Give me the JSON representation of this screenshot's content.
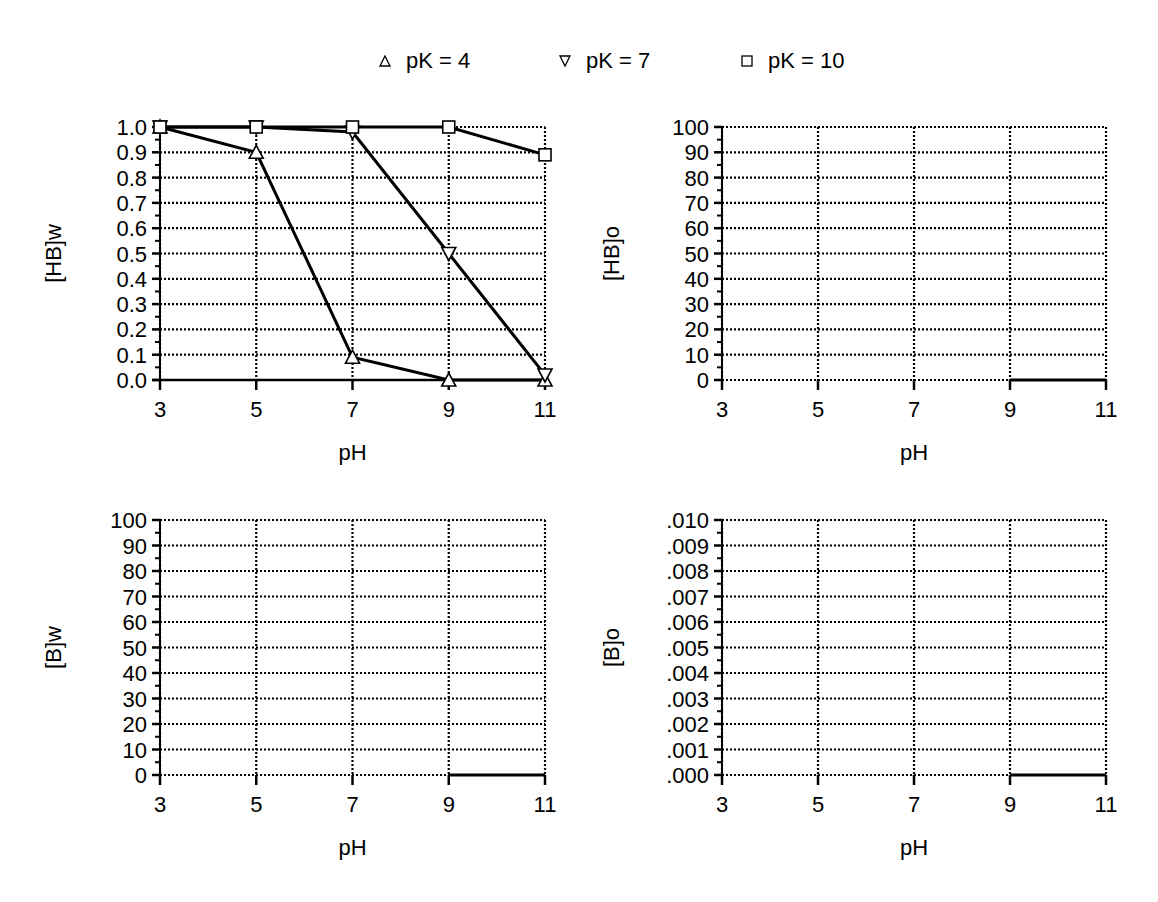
{
  "legend": {
    "items": [
      {
        "label": "pK = 4",
        "marker": "triangle-up",
        "x": 378
      },
      {
        "label": "pK = 7",
        "marker": "triangle-down",
        "x": 558
      },
      {
        "label": "pK = 10",
        "marker": "square",
        "x": 740
      }
    ]
  },
  "chart_data": [
    {
      "id": "hb-w",
      "type": "line",
      "title": "",
      "xlabel": "pH",
      "ylabel": "[HB]w",
      "x": [
        3,
        5,
        7,
        9,
        11
      ],
      "xticks": [
        "3",
        "5",
        "7",
        "9",
        "11"
      ],
      "ylim": [
        0,
        1.0
      ],
      "yticks": [
        "0.0",
        "0.1",
        "0.2",
        "0.3",
        "0.4",
        "0.5",
        "0.6",
        "0.7",
        "0.8",
        "0.9",
        "1.0"
      ],
      "grid": true,
      "legend_position": "top",
      "series": [
        {
          "name": "pK = 4",
          "marker": "triangle-up",
          "values": [
            1.0,
            0.9,
            0.09,
            0.0,
            0.0
          ]
        },
        {
          "name": "pK = 7",
          "marker": "triangle-down",
          "values": [
            1.0,
            1.0,
            0.98,
            0.5,
            0.02
          ]
        },
        {
          "name": "pK = 10",
          "marker": "square",
          "values": [
            1.0,
            1.0,
            1.0,
            1.0,
            0.89
          ]
        }
      ],
      "frame": {
        "left": 160,
        "right": 545,
        "top": 127,
        "bottom": 380
      }
    },
    {
      "id": "hb-o",
      "type": "line",
      "title": "",
      "xlabel": "pH",
      "ylabel": "[HB]o",
      "x": [
        3,
        5,
        7,
        9,
        11
      ],
      "xticks": [
        "3",
        "5",
        "7",
        "9",
        "11"
      ],
      "ylim": [
        0,
        100
      ],
      "yticks": [
        "0",
        "10",
        "20",
        "30",
        "40",
        "50",
        "60",
        "70",
        "80",
        "90",
        "100"
      ],
      "grid": true,
      "series": [
        {
          "name": "baseline",
          "values": [
            null,
            null,
            null,
            0,
            0
          ]
        }
      ],
      "frame": {
        "left": 722,
        "right": 1106,
        "top": 127,
        "bottom": 380
      }
    },
    {
      "id": "b-w",
      "type": "line",
      "title": "",
      "xlabel": "pH",
      "ylabel": "[B]w",
      "x": [
        3,
        5,
        7,
        9,
        11
      ],
      "xticks": [
        "3",
        "5",
        "7",
        "9",
        "11"
      ],
      "ylim": [
        0,
        100
      ],
      "yticks": [
        "0",
        "10",
        "20",
        "30",
        "40",
        "50",
        "60",
        "70",
        "80",
        "90",
        "100"
      ],
      "grid": true,
      "series": [
        {
          "name": "baseline",
          "values": [
            null,
            null,
            null,
            0,
            0
          ]
        }
      ],
      "frame": {
        "left": 160,
        "right": 545,
        "top": 520,
        "bottom": 775
      }
    },
    {
      "id": "b-o",
      "type": "line",
      "title": "",
      "xlabel": "pH",
      "ylabel": "[B]o",
      "x": [
        3,
        5,
        7,
        9,
        11
      ],
      "xticks": [
        "3",
        "5",
        "7",
        "9",
        "11"
      ],
      "ylim": [
        0,
        0.01
      ],
      "yticks": [
        ".000",
        ".001",
        ".002",
        ".003",
        ".004",
        ".005",
        ".006",
        ".007",
        ".008",
        ".009",
        ".010"
      ],
      "grid": true,
      "series": [
        {
          "name": "baseline",
          "values": [
            null,
            null,
            null,
            0,
            0
          ]
        }
      ],
      "frame": {
        "left": 722,
        "right": 1106,
        "top": 520,
        "bottom": 775
      }
    }
  ]
}
